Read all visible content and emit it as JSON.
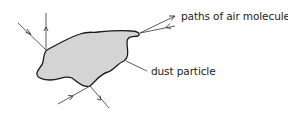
{
  "diagram": {
    "labels": {
      "molecule_paths": "paths of air molecules",
      "particle": "dust particle"
    },
    "colors": {
      "particle_fill": "#d4d4d4",
      "outline": "#1a1a1a",
      "lines": "#333333"
    }
  }
}
